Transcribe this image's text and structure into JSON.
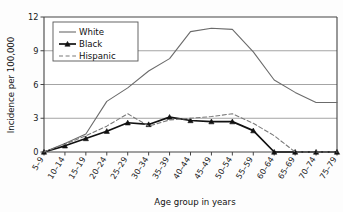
{
  "chart_data": {
    "type": "line",
    "title": "",
    "xlabel": "Age group in years",
    "ylabel": "Incidence per 100,000",
    "categories": [
      "5–9",
      "10–14",
      "15–19",
      "20–24",
      "25–29",
      "30–34",
      "35–39",
      "40–44",
      "45–49",
      "50–54",
      "55–59",
      "60–64",
      "65–69",
      "70–74",
      "75–79"
    ],
    "ylim": [
      0,
      12
    ],
    "yticks": [
      0,
      3,
      6,
      9,
      12
    ],
    "ytick_labels": [
      "0",
      "3",
      "6",
      "9",
      "12"
    ],
    "grid": "horizontal",
    "legend_position": "top-left",
    "series": [
      {
        "name": "White",
        "style": "solid",
        "color": "#6b6b6b",
        "marker": "none",
        "values": [
          0,
          0.75,
          1.6,
          4.5,
          5.7,
          7.2,
          8.3,
          10.7,
          11.0,
          10.9,
          8.9,
          6.4,
          5.3,
          4.4,
          4.4
        ]
      },
      {
        "name": "Black",
        "style": "solid",
        "color": "#111111",
        "marker": "triangle",
        "values": [
          0,
          0.55,
          1.2,
          1.85,
          2.6,
          2.45,
          3.1,
          2.8,
          2.7,
          2.7,
          1.9,
          0,
          0,
          0,
          0
        ]
      },
      {
        "name": "Hispanic",
        "style": "dashed",
        "color": "#7a7a7a",
        "marker": "none",
        "values": [
          0,
          0.7,
          1.45,
          2.3,
          3.4,
          2.3,
          2.85,
          3.0,
          3.15,
          3.4,
          2.55,
          1.45,
          0,
          0,
          0
        ]
      }
    ]
  },
  "legend": {
    "items": [
      {
        "label": "White"
      },
      {
        "label": "Black"
      },
      {
        "label": "Hispanic"
      }
    ]
  }
}
